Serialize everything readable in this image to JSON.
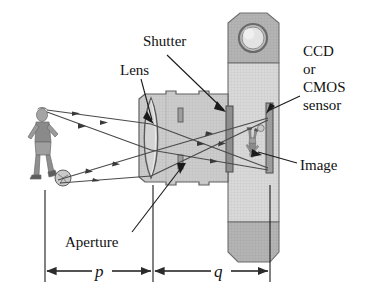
{
  "figure": {
    "labels": {
      "shutter": "Shutter",
      "lens": "Lens",
      "ccd": "CCD",
      "or": "or",
      "cmos": "CMOS",
      "sensor": "sensor",
      "image": "Image",
      "aperture": "Aperture",
      "object_distance": "p",
      "image_distance": "q"
    },
    "colors": {
      "ink": "#111111",
      "body_light": "#d8d8d8",
      "body_mid": "#c2c2c2",
      "body_dark": "#a9a9a9",
      "barrel": "#d2d2d2",
      "lens_glass": "#cfcfcf",
      "shutter_bar": "#8e8e8e",
      "sensor_bar": "#9a9a9a",
      "ray": "#4a4a4a",
      "figure_gray": "#8a8a8a"
    }
  }
}
